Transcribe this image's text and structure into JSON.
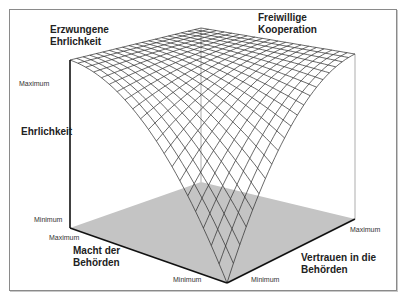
{
  "diagram": {
    "type": "3d-surface",
    "labels": {
      "corner_left_top": [
        "Erzwungene",
        "Ehrlichkeit"
      ],
      "corner_right_top": [
        "Freiwillige",
        "Kooperation"
      ],
      "z_axis": "Ehrlichkeit",
      "x_axis": [
        "Macht der",
        "Behörden"
      ],
      "y_axis": [
        "Vertrauen in die",
        "Behörden"
      ]
    },
    "ticks": {
      "z_max": "Maximum",
      "z_min": "Minimum",
      "x_max": "Maximum",
      "x_min": "Minimum",
      "y_max": "Maximum",
      "y_min": "Minimum"
    },
    "grid_divisions": 20,
    "colors": {
      "floor": "#c4c4c4",
      "mesh": "#2a2a2a",
      "axis": "#111111",
      "frame": "#8a8a8a"
    }
  }
}
